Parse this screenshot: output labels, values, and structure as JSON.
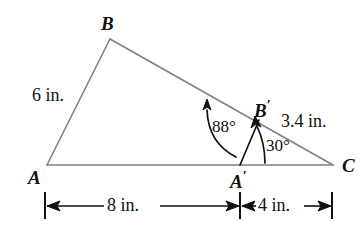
{
  "figure": {
    "type": "geometry-diagram",
    "colors": {
      "triangle_stroke": "#808080",
      "annotation_stroke": "#111111",
      "text": "#111111",
      "background": "#ffffff"
    }
  },
  "vertices": {
    "A": {
      "label": "A",
      "x": 47,
      "y": 165
    },
    "B": {
      "label": "B",
      "x": 110,
      "y": 39
    },
    "C": {
      "label": "C",
      "x": 333,
      "y": 165
    },
    "A_prime": {
      "label": "A",
      "prime": "′",
      "x": 240,
      "y": 165
    },
    "B_prime": {
      "label": "B",
      "prime": "′",
      "x": 258,
      "y": 122
    }
  },
  "side_labels": {
    "AB": "6 in.",
    "A_prime_B_prime": "3.4 in."
  },
  "angle_labels": {
    "at_A_prime_interior": "88°",
    "at_A_prime_to_B_prime": "30°"
  },
  "dimensions": [
    {
      "label": "8 in.",
      "from": "A",
      "to": "A′",
      "x_start": 45,
      "x_end": 240
    },
    {
      "label": "4 in.",
      "from": "A′",
      "to": "C",
      "x_start": 240,
      "x_end": 332
    }
  ],
  "dimension_line_y": 205
}
